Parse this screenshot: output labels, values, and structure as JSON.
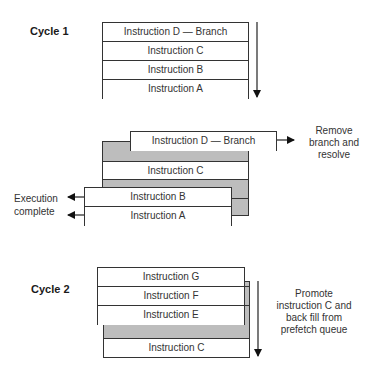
{
  "diagram": {
    "cycle1": {
      "label": "Cycle 1",
      "queue": [
        "Instruction D — Branch",
        "Instruction C",
        "Instruction B",
        "Instruction A"
      ]
    },
    "transition": {
      "branch_row": "Instruction D — Branch",
      "middle_row": "Instruction C",
      "completed_rows": [
        "Instruction B",
        "Instruction A"
      ],
      "right_note": [
        "Remove",
        "branch and",
        "resolve"
      ],
      "left_note": [
        "Execution",
        "complete"
      ]
    },
    "cycle2": {
      "label": "Cycle 2",
      "front_rows": [
        "Instruction  G",
        "Instruction F",
        "Instruction E"
      ],
      "back_row": "Instruction C",
      "note": [
        "Promote",
        "instruction C and",
        "back fill from",
        "prefetch queue"
      ]
    },
    "colors": {
      "shaded": "#bdbdbd",
      "line": "#333333"
    }
  }
}
